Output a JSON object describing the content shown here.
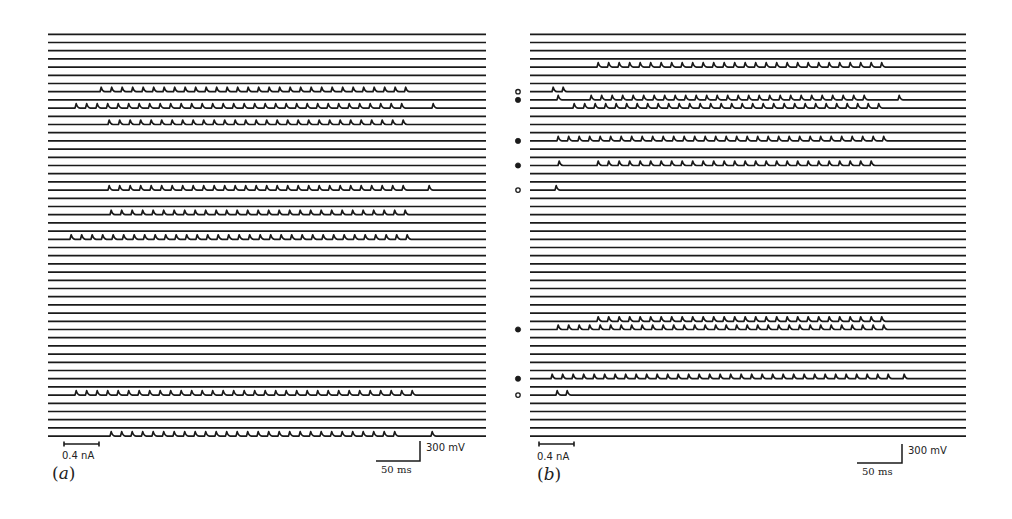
{
  "chart_data": {
    "type": "line",
    "title": "",
    "layout": {
      "rows_per_panel": 50,
      "row_spacing_px": 8.2,
      "first_row_y_px": 34.3,
      "grid": false,
      "legend": "none"
    },
    "panels": [
      {
        "id": "a",
        "label": "(a)",
        "x_range_px": [
          48,
          486
        ],
        "current_scale_label": "0.4 nA",
        "time_scale_label": "50 ms",
        "voltage_scale_label": "300 mV",
        "spike_rows": [
          {
            "row": 7,
            "train": [
              100,
              413
            ],
            "isolated": []
          },
          {
            "row": 9,
            "train": [
              75,
              403
            ],
            "isolated": [
              432
            ]
          },
          {
            "row": 11,
            "train": [
              108,
              407
            ],
            "isolated": []
          },
          {
            "row": 19,
            "train": [
              108,
              403
            ],
            "isolated": [
              428
            ]
          },
          {
            "row": 22,
            "train": [
              110,
              411
            ],
            "isolated": []
          },
          {
            "row": 25,
            "train": [
              70,
              413
            ],
            "isolated": []
          },
          {
            "row": 44,
            "train": [
              75,
              417
            ],
            "isolated": []
          },
          {
            "row": 49,
            "train": [
              110,
              403
            ],
            "isolated": [
              431
            ]
          }
        ],
        "markers": []
      },
      {
        "id": "b",
        "label": "(b)",
        "x_range_px": [
          530,
          966
        ],
        "current_scale_label": "0.4 nA",
        "time_scale_label": "50 ms",
        "voltage_scale_label": "300 mV",
        "spike_rows": [
          {
            "row": 4,
            "train": [
              597,
              885
            ],
            "isolated": []
          },
          {
            "row": 7,
            "train": null,
            "isolated": [
              552,
              562
            ]
          },
          {
            "row": 8,
            "train": [
              590,
              873
            ],
            "isolated": [
              557,
              898
            ]
          },
          {
            "row": 9,
            "train": [
              573,
              887
            ],
            "isolated": []
          },
          {
            "row": 13,
            "train": [
              557,
              884
            ],
            "isolated": []
          },
          {
            "row": 16,
            "train": [
              597,
              872
            ],
            "isolated": [
              558
            ]
          },
          {
            "row": 19,
            "train": null,
            "isolated": [
              555
            ]
          },
          {
            "row": 35,
            "train": [
              597,
              885
            ],
            "isolated": []
          },
          {
            "row": 36,
            "train": [
              557,
              885
            ],
            "isolated": []
          },
          {
            "row": 42,
            "train": [
              551,
              893
            ],
            "isolated": [
              903
            ]
          },
          {
            "row": 44,
            "train": null,
            "isolated": [
              556,
              566
            ]
          }
        ],
        "markers": [
          {
            "row": 7,
            "type": "open"
          },
          {
            "row": 8,
            "type": "filled"
          },
          {
            "row": 13,
            "type": "filled"
          },
          {
            "row": 16,
            "type": "filled"
          },
          {
            "row": 19,
            "type": "open"
          },
          {
            "row": 36,
            "type": "filled"
          },
          {
            "row": 42,
            "type": "filled"
          },
          {
            "row": 44,
            "type": "open"
          }
        ]
      }
    ],
    "spike_period_px": 10.5,
    "spike_height_px": 4.5,
    "trace_color": "#1a1a1a"
  },
  "labels": {
    "a": {
      "current": "0.4 nA",
      "voltage": "300 mV",
      "time": "50 ms",
      "panel_letter": "a"
    },
    "b": {
      "current": "0.4 nA",
      "voltage": "300 mV",
      "time": "50 ms",
      "panel_letter": "b"
    }
  }
}
